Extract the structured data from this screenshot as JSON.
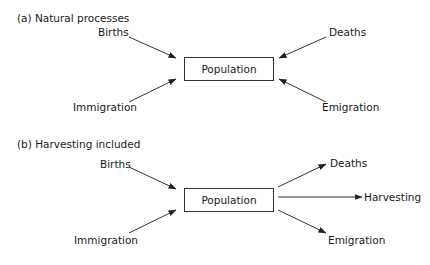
{
  "panels": [
    {
      "title": "(a) Natural processes",
      "center": "Population",
      "inputs": [
        "Births",
        "Immigration",
        "Deaths",
        "Emigration"
      ],
      "outputs": []
    },
    {
      "title": "(b) Harvesting included",
      "center": "Population",
      "inputs": [
        "Births",
        "Immigration"
      ],
      "outputs": [
        "Deaths",
        "Harvesting",
        "Emigration"
      ]
    }
  ],
  "a": {
    "title": "(a) Natural processes",
    "center": "Population",
    "births": "Births",
    "deaths": "Deaths",
    "immigration": "Immigration",
    "emigration": "Emigration"
  },
  "b": {
    "title": "(b) Harvesting included",
    "center": "Population",
    "births": "Births",
    "deaths": "Deaths",
    "harvesting": "Harvesting",
    "immigration": "Immigration",
    "emigration": "Emigration"
  }
}
